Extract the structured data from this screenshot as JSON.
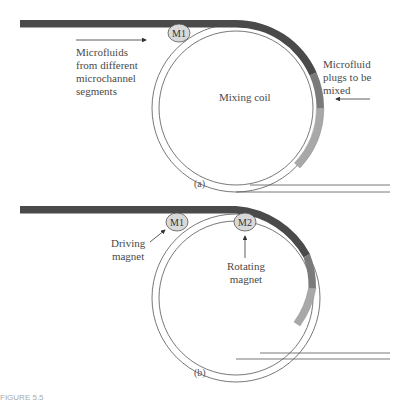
{
  "panel_a": {
    "magnet_m1": "M1",
    "left_label": [
      "Microfluids",
      "from different",
      "microchannel",
      "segments"
    ],
    "coil_label": "Mixing coil",
    "right_label": [
      "Microfluid",
      "plugs to be",
      "mixed"
    ],
    "caption": "(a)"
  },
  "panel_b": {
    "magnet_m1": "M1",
    "magnet_m2": "M2",
    "driving_label": [
      "Driving",
      "magnet"
    ],
    "rotating_label": [
      "Rotating",
      "magnet"
    ],
    "caption": "(b)"
  },
  "figure_label": "FIGURE 5.5",
  "colors": {
    "channel_dark": "#4a4a4a",
    "plug_mid": "#7a7a7a",
    "plug_light": "#a8a8a8",
    "magnet_fill": "#d9d9d9",
    "line": "#555555"
  }
}
